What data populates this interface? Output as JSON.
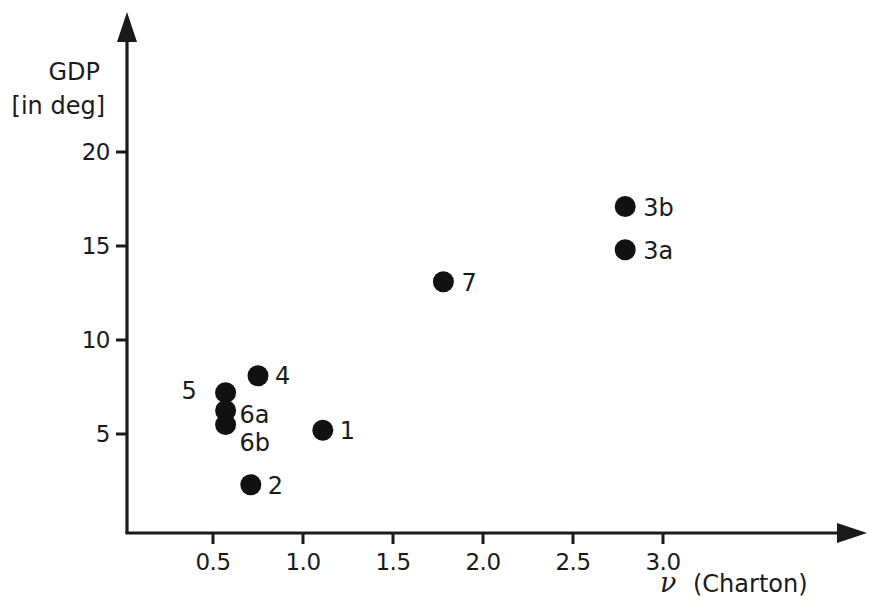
{
  "chart_data": {
    "type": "scatter",
    "title": "",
    "xlabel": "ν (Charton)",
    "ylabel": "GDP [in deg]",
    "ylabel_line1": "GDP",
    "ylabel_line2": "[in deg]",
    "xlabel_symbol": "ν",
    "xlabel_text": "(Charton)",
    "xlim": [
      0,
      3.25
    ],
    "ylim": [
      0,
      21.5
    ],
    "xticks": [
      0.5,
      1.0,
      1.5,
      2.0,
      2.5,
      3.0
    ],
    "xtick_labels": [
      "0.5",
      "1.0",
      "1.5",
      "2.0",
      "2.5",
      "3.0"
    ],
    "yticks": [
      5,
      10,
      15,
      20
    ],
    "ytick_labels": [
      "5",
      "10",
      "15",
      "20"
    ],
    "grid": false,
    "legend": "none",
    "marker": "filled-circle",
    "marker_color": "#111111",
    "axis_color": "#1a1a1a",
    "points": [
      {
        "label": "1",
        "x": 1.11,
        "y": 5.2,
        "label_dx": 17,
        "label_dy": 9
      },
      {
        "label": "2",
        "x": 0.71,
        "y": 2.3,
        "label_dx": 17,
        "label_dy": 9
      },
      {
        "label": "3a",
        "x": 2.79,
        "y": 14.8,
        "label_dx": 18,
        "label_dy": 9
      },
      {
        "label": "3b",
        "x": 2.79,
        "y": 17.1,
        "label_dx": 18,
        "label_dy": 9
      },
      {
        "label": "4",
        "x": 0.75,
        "y": 8.1,
        "label_dx": 17,
        "label_dy": 8
      },
      {
        "label": "5",
        "x": 0.57,
        "y": 7.2,
        "label_dx": -44,
        "label_dy": 6
      },
      {
        "label": "6a",
        "x": 0.57,
        "y": 6.25,
        "label_dx": 14,
        "label_dy": 12
      },
      {
        "label": "6b",
        "x": 0.57,
        "y": 5.5,
        "label_dx": 14,
        "label_dy": 26
      },
      {
        "label": "7",
        "x": 1.78,
        "y": 13.1,
        "label_dx": 18,
        "label_dy": 9
      }
    ]
  },
  "axes": {
    "y_title_line1": "GDP",
    "y_title_line2": "[in deg]",
    "x_title_symbol": "ν",
    "x_title_rest": "(Charton)"
  }
}
